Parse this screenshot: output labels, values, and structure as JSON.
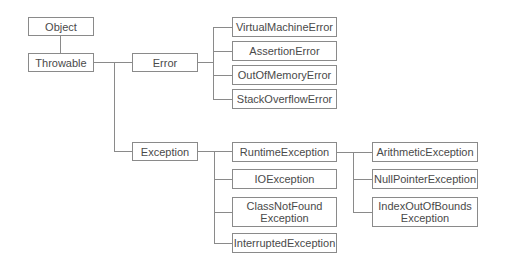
{
  "diagram": {
    "title": "",
    "nodes": {
      "object": "Object",
      "throwable": "Throwable",
      "error": "Error",
      "virtual_machine_error": "VirtualMachineError",
      "assertion_error": "AssertionError",
      "out_of_memory_error": "OutOfMemoryError",
      "stack_overflow_error": "StackOverflowError",
      "exception": "Exception",
      "runtime_exception": "RuntimeException",
      "io_exception": "IOException",
      "class_not_found_exception": "ClassNotFound\nException",
      "interrupted_exception": "InterruptedException",
      "arithmetic_exception": "ArithmeticException",
      "null_pointer_exception": "NullPointerException",
      "index_out_of_bounds_exception": "IndexOutOfBounds\nException"
    },
    "edges": [
      [
        "Object",
        "Throwable"
      ],
      [
        "Throwable",
        "Error"
      ],
      [
        "Throwable",
        "Exception"
      ],
      [
        "Error",
        "VirtualMachineError"
      ],
      [
        "Error",
        "AssertionError"
      ],
      [
        "Error",
        "OutOfMemoryError"
      ],
      [
        "Error",
        "StackOverflowError"
      ],
      [
        "Exception",
        "RuntimeException"
      ],
      [
        "Exception",
        "IOException"
      ],
      [
        "Exception",
        "ClassNotFoundException"
      ],
      [
        "Exception",
        "InterruptedException"
      ],
      [
        "RuntimeException",
        "ArithmeticException"
      ],
      [
        "RuntimeException",
        "NullPointerException"
      ],
      [
        "RuntimeException",
        "IndexOutOfBoundsException"
      ]
    ],
    "colors": {
      "line": "#8a8a8a",
      "text": "#4a4a4a",
      "background": "#ffffff"
    }
  }
}
